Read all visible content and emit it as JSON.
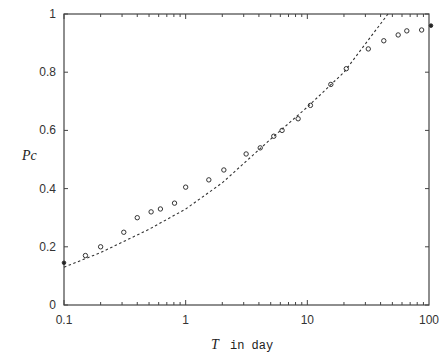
{
  "chart_data": {
    "type": "scatter",
    "title": "",
    "xlabel": "T in day",
    "xlabel_var": "T",
    "xlabel_unit": "in day",
    "ylabel": "Pc",
    "xscale": "log",
    "xlim": [
      0.1,
      100
    ],
    "ylim": [
      0,
      1
    ],
    "grid": false,
    "legend": null,
    "x_ticks": [
      "0.1",
      "1",
      "10",
      "100"
    ],
    "y_ticks": [
      "0",
      "0.2",
      "0.4",
      "0.6",
      "0.8",
      "1"
    ],
    "series": [
      {
        "name": "observed",
        "style": "open-circle",
        "points": [
          [
            0.1,
            0.145
          ],
          [
            0.15,
            0.17
          ],
          [
            0.2,
            0.2
          ],
          [
            0.31,
            0.25
          ],
          [
            0.4,
            0.3
          ],
          [
            0.52,
            0.32
          ],
          [
            0.62,
            0.33
          ],
          [
            0.81,
            0.35
          ],
          [
            1.0,
            0.405
          ],
          [
            1.55,
            0.43
          ],
          [
            2.06,
            0.464
          ],
          [
            3.14,
            0.519
          ],
          [
            4.1,
            0.54
          ],
          [
            5.3,
            0.58
          ],
          [
            6.2,
            0.6
          ],
          [
            8.4,
            0.64
          ],
          [
            10.6,
            0.686
          ],
          [
            15.6,
            0.758
          ],
          [
            20.9,
            0.812
          ],
          [
            31.7,
            0.88
          ],
          [
            42.5,
            0.908
          ],
          [
            55.8,
            0.928
          ],
          [
            65.7,
            0.942
          ],
          [
            87,
            0.945
          ],
          [
            100,
            0.96
          ]
        ]
      },
      {
        "name": "fit",
        "style": "dashed-line",
        "points": [
          [
            0.1,
            0.13
          ],
          [
            0.2,
            0.18
          ],
          [
            0.5,
            0.26
          ],
          [
            1.0,
            0.33
          ],
          [
            2.0,
            0.42
          ],
          [
            5.0,
            0.57
          ],
          [
            10,
            0.68
          ],
          [
            20,
            0.8
          ],
          [
            46,
            1.0
          ]
        ]
      }
    ]
  }
}
